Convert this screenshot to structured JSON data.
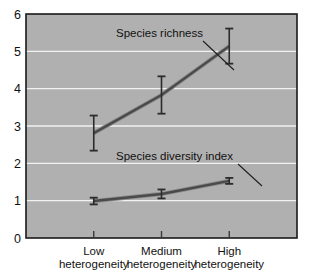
{
  "chart_data": {
    "type": "line",
    "title": "",
    "subtitle": "",
    "xlabel": "",
    "ylabel": "",
    "categories": [
      "Low\nheterogeneity",
      "Medium\nheterogeneity",
      "High\nheterogeneity"
    ],
    "category_lines": [
      [
        "Low",
        "heterogeneity"
      ],
      [
        "Medium",
        "heterogeneity"
      ],
      [
        "High",
        "heterogeneity"
      ]
    ],
    "xlim": [
      0,
      4
    ],
    "ylim": [
      0,
      6
    ],
    "yticks": [
      0,
      1,
      2,
      3,
      4,
      5,
      6
    ],
    "ytick_labels": [
      "0",
      "1",
      "2",
      "3",
      "4",
      "5",
      "6"
    ],
    "grid": true,
    "grid_axis": "y",
    "legend": "annotations",
    "legend_position": "inline-callout",
    "plot_background": "#b0b0b0",
    "grid_color": "#f2f2f2",
    "line_color": "#4a4a4a",
    "errorbar_color": "#2b2b2b",
    "axis_color": "#1a1a1a",
    "series": [
      {
        "name": "Species richness",
        "values": [
          2.81,
          3.83,
          5.14
        ],
        "errors": [
          0.47,
          0.5,
          0.47
        ],
        "annotation": {
          "label": "Species richness",
          "text_x": 116,
          "text_y": 37,
          "leader_from_x": 203,
          "leader_from_y": 41,
          "leader_to_x": 234,
          "leader_to_y": 70
        }
      },
      {
        "name": "Species diversity index",
        "values": [
          0.99,
          1.18,
          1.53
        ],
        "errors": [
          0.09,
          0.12,
          0.08
        ],
        "annotation": {
          "label": "Species diversity index",
          "text_x": 116,
          "text_y": 160,
          "leader_from_x": 238,
          "leader_from_y": 164,
          "leader_to_x": 262,
          "leader_to_y": 186
        }
      }
    ]
  }
}
